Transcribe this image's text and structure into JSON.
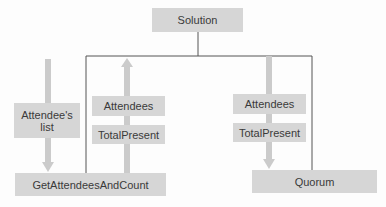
{
  "diagram": {
    "type": "structure-chart",
    "colors": {
      "box_fill": "#d6d6d6",
      "box_text": "#3a3a3a",
      "arrow": "#cbcbcb",
      "connector": "#555555",
      "background": "#fdfdfd"
    },
    "modules": {
      "root": {
        "label": "Solution"
      },
      "left": {
        "label": "GetAttendeesAndCount"
      },
      "right": {
        "label": "Quorum"
      }
    },
    "flows": {
      "input_to_left": {
        "label": "Attendee's\nlist",
        "direction": "down",
        "target": "GetAttendeesAndCount"
      },
      "left_outputs": {
        "direction": "up",
        "source": "GetAttendeesAndCount",
        "labels": [
          "Attendees",
          "TotalPresent"
        ]
      },
      "right_inputs": {
        "direction": "down",
        "target": "Quorum",
        "labels": [
          "Attendees",
          "TotalPresent"
        ]
      }
    }
  }
}
